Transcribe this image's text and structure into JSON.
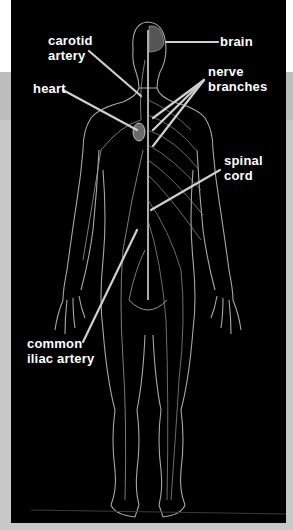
{
  "diagram": {
    "labels": {
      "carotid_artery_1": "carotid",
      "carotid_artery_2": "artery",
      "brain": "brain",
      "nerve_branches_1": "nerve",
      "nerve_branches_2": "branches",
      "heart": "heart",
      "spinal_cord_1": "spinal",
      "spinal_cord_2": "cord",
      "common_iliac_artery_1": "common",
      "common_iliac_artery_2": "iliac artery"
    },
    "colors": {
      "panel_background": "#000000",
      "label_text": "#ffffff",
      "leader_line": "#cfcfcf",
      "body_outline": "#bfbfbf"
    }
  }
}
